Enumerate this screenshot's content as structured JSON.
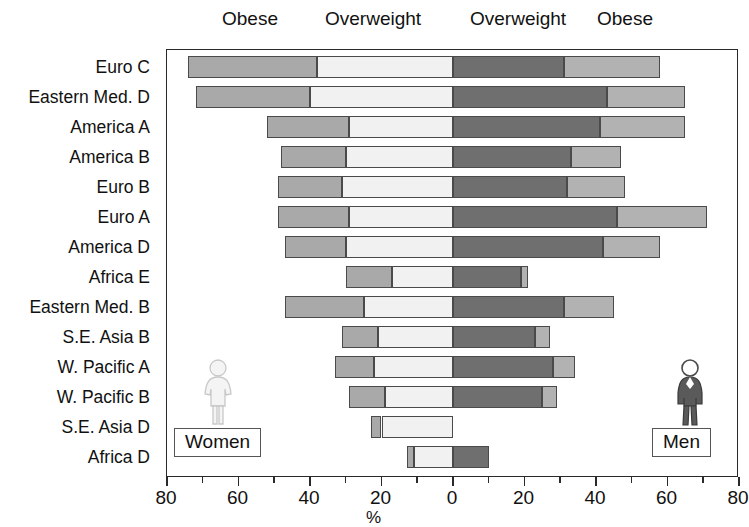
{
  "header": {
    "women_obese_label": "Obese",
    "women_overweight_label": "Overweight",
    "men_overweight_label": "Overweight",
    "men_obese_label": "Obese"
  },
  "legend": {
    "women_label": "Women",
    "men_label": "Men",
    "women_icon": "female-figure-icon",
    "men_icon": "male-figure-icon"
  },
  "colors": {
    "women_obese": "#a9a9a9",
    "women_overweight": "#f1f1f1",
    "men_overweight": "#6f6f6f",
    "men_obese": "#b2b2b2",
    "axis": "#2a2a2a",
    "text": "#111111"
  },
  "chart_data": {
    "type": "bar",
    "title": "",
    "subtitle": "",
    "orientation": "horizontal-diverging",
    "xlabel": "%",
    "ylabel": "",
    "xlim": [
      -80,
      80
    ],
    "xticks": [
      -80,
      -60,
      -40,
      -20,
      0,
      20,
      40,
      60,
      80
    ],
    "xticklabels": [
      "80",
      "60",
      "40",
      "20",
      "0",
      "20",
      "40",
      "60",
      "80"
    ],
    "minor_tick_step": 10,
    "grid": false,
    "legend_position": "outside-bottom-left-and-right",
    "note": "Left side shows Women (values plotted leftward from 0); right side shows Men. Each side is stacked: Overweight adjacent to 0, Obese at the outer end.",
    "categories": [
      "Euro C",
      "Eastern Med. D",
      "America A",
      "America B",
      "Euro B",
      "Euro A",
      "America D",
      "Africa E",
      "Eastern Med. B",
      "S.E. Asia B",
      "W. Pacific A",
      "W. Pacific B",
      "S.E. Asia D",
      "Africa D"
    ],
    "series": [
      {
        "name": "Women Obese",
        "side": "left",
        "color": "#a9a9a9",
        "values": [
          36,
          32,
          23,
          18,
          18,
          20,
          17,
          13,
          22,
          10,
          11,
          10,
          3,
          2
        ]
      },
      {
        "name": "Women Overweight",
        "side": "left",
        "color": "#f1f1f1",
        "values": [
          38,
          40,
          29,
          30,
          31,
          29,
          30,
          17,
          25,
          21,
          22,
          19,
          20,
          11
        ]
      },
      {
        "name": "Men Overweight",
        "side": "right",
        "color": "#6f6f6f",
        "values": [
          31,
          43,
          41,
          33,
          32,
          46,
          42,
          19,
          31,
          23,
          28,
          25,
          0,
          10
        ]
      },
      {
        "name": "Men Obese",
        "side": "right",
        "color": "#b2b2b2",
        "values": [
          27,
          22,
          24,
          14,
          16,
          25,
          16,
          2,
          14,
          4,
          6,
          4,
          0,
          0
        ]
      }
    ],
    "rows": [
      {
        "category": "Euro C",
        "women_obese": 36,
        "women_overweight": 38,
        "men_overweight": 31,
        "men_obese": 27,
        "women_total": 74,
        "men_total": 58
      },
      {
        "category": "Eastern Med. D",
        "women_obese": 32,
        "women_overweight": 40,
        "men_overweight": 43,
        "men_obese": 22,
        "women_total": 72,
        "men_total": 65
      },
      {
        "category": "America A",
        "women_obese": 23,
        "women_overweight": 29,
        "men_overweight": 41,
        "men_obese": 24,
        "women_total": 52,
        "men_total": 65
      },
      {
        "category": "America B",
        "women_obese": 18,
        "women_overweight": 30,
        "men_overweight": 33,
        "men_obese": 14,
        "women_total": 48,
        "men_total": 47
      },
      {
        "category": "Euro B",
        "women_obese": 18,
        "women_overweight": 31,
        "men_overweight": 32,
        "men_obese": 16,
        "women_total": 49,
        "men_total": 48
      },
      {
        "category": "Euro A",
        "women_obese": 20,
        "women_overweight": 29,
        "men_overweight": 46,
        "men_obese": 25,
        "women_total": 49,
        "men_total": 71
      },
      {
        "category": "America D",
        "women_obese": 17,
        "women_overweight": 30,
        "men_overweight": 42,
        "men_obese": 16,
        "women_total": 47,
        "men_total": 58
      },
      {
        "category": "Africa E",
        "women_obese": 13,
        "women_overweight": 17,
        "men_overweight": 19,
        "men_obese": 2,
        "women_total": 30,
        "men_total": 21
      },
      {
        "category": "Eastern Med. B",
        "women_obese": 22,
        "women_overweight": 25,
        "men_overweight": 31,
        "men_obese": 14,
        "women_total": 47,
        "men_total": 45
      },
      {
        "category": "S.E. Asia B",
        "women_obese": 10,
        "women_overweight": 21,
        "men_overweight": 23,
        "men_obese": 4,
        "women_total": 31,
        "men_total": 27
      },
      {
        "category": "W. Pacific A",
        "women_obese": 11,
        "women_overweight": 22,
        "men_overweight": 28,
        "men_obese": 6,
        "women_total": 33,
        "men_total": 34
      },
      {
        "category": "W. Pacific B",
        "women_obese": 10,
        "women_overweight": 19,
        "men_overweight": 25,
        "men_obese": 4,
        "women_total": 29,
        "men_total": 29
      },
      {
        "category": "S.E. Asia D",
        "women_obese": 3,
        "women_overweight": 20,
        "men_overweight": 0,
        "men_obese": 0,
        "women_total": 23,
        "men_total": 0
      },
      {
        "category": "Africa D",
        "women_obese": 2,
        "women_overweight": 11,
        "men_overweight": 10,
        "men_obese": 0,
        "women_total": 13,
        "men_total": 10
      }
    ]
  },
  "axis": {
    "title": "%",
    "labels": [
      "80",
      "60",
      "40",
      "20",
      "0",
      "20",
      "40",
      "60",
      "80"
    ]
  }
}
